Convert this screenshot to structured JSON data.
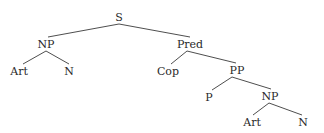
{
  "diagram": {
    "type": "syntax-tree",
    "nodes": [
      {
        "id": "s",
        "label": "S",
        "x": 119,
        "y": 17
      },
      {
        "id": "np1",
        "label": "NP",
        "x": 46,
        "y": 44
      },
      {
        "id": "art1",
        "label": "Art",
        "x": 19,
        "y": 71
      },
      {
        "id": "n1",
        "label": "N",
        "x": 69,
        "y": 71
      },
      {
        "id": "pred",
        "label": "Pred",
        "x": 190,
        "y": 44
      },
      {
        "id": "cop",
        "label": "Cop",
        "x": 168,
        "y": 71
      },
      {
        "id": "pp",
        "label": "PP",
        "x": 237,
        "y": 70
      },
      {
        "id": "p",
        "label": "P",
        "x": 209,
        "y": 97
      },
      {
        "id": "np2",
        "label": "NP",
        "x": 270,
        "y": 96
      },
      {
        "id": "art2",
        "label": "Art",
        "x": 252,
        "y": 122
      },
      {
        "id": "n2",
        "label": "N",
        "x": 303,
        "y": 122
      }
    ],
    "edges": [
      {
        "from": "s",
        "to": "np1",
        "x1": 119,
        "y1": 24,
        "x2": 48,
        "y2": 37
      },
      {
        "from": "s",
        "to": "pred",
        "x1": 119,
        "y1": 24,
        "x2": 190,
        "y2": 37
      },
      {
        "from": "np1",
        "to": "art1",
        "x1": 46,
        "y1": 51,
        "x2": 23,
        "y2": 64
      },
      {
        "from": "np1",
        "to": "n1",
        "x1": 46,
        "y1": 51,
        "x2": 69,
        "y2": 64
      },
      {
        "from": "pred",
        "to": "cop",
        "x1": 187,
        "y1": 51,
        "x2": 171,
        "y2": 64
      },
      {
        "from": "pred",
        "to": "pp",
        "x1": 187,
        "y1": 51,
        "x2": 236,
        "y2": 63
      },
      {
        "from": "pp",
        "to": "p",
        "x1": 232,
        "y1": 77,
        "x2": 212,
        "y2": 90
      },
      {
        "from": "pp",
        "to": "np2",
        "x1": 232,
        "y1": 77,
        "x2": 271,
        "y2": 89
      },
      {
        "from": "np2",
        "to": "art2",
        "x1": 269,
        "y1": 103,
        "x2": 253,
        "y2": 115
      },
      {
        "from": "np2",
        "to": "n2",
        "x1": 269,
        "y1": 103,
        "x2": 302,
        "y2": 115
      }
    ]
  }
}
